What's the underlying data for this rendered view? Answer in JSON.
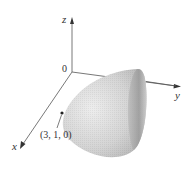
{
  "figure": {
    "type": "3d-surface-diagram",
    "surface": "elliptic paraboloid opening along the positive y-axis",
    "axes": {
      "z_label": "z",
      "y_label": "y",
      "x_label": "x",
      "origin_label": "0"
    },
    "point": {
      "label": "(3, 1, 0)"
    },
    "colors": {
      "axis": "#555555",
      "surface_light": "#e4e4e4",
      "surface_dark": "#9a9a9a",
      "text": "#333333"
    }
  }
}
